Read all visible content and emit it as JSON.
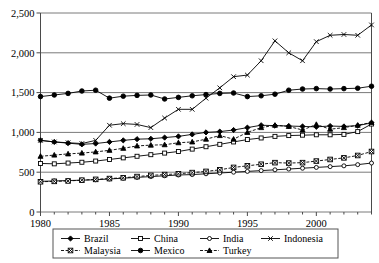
{
  "title_cropped": "",
  "chart_data": {
    "type": "line",
    "title": "",
    "subtitle": "",
    "xlabel": "",
    "ylabel": "",
    "xlim": [
      1980,
      2004
    ],
    "ylim": [
      0,
      2500
    ],
    "yticks": [
      0,
      500,
      1000,
      1500,
      2000,
      2500
    ],
    "ytick_labels": [
      "0",
      "500",
      "1,000",
      "1,500",
      "2,000",
      "2,500"
    ],
    "xticks": [
      1980,
      1985,
      1990,
      1995,
      2000
    ],
    "xtick_labels": [
      "1980",
      "1985",
      "1990",
      "1995",
      "2000"
    ],
    "x_minor_ticks_every": 1,
    "grid": "horizontal",
    "legend_position": "bottom",
    "x": [
      1980,
      1981,
      1982,
      1983,
      1984,
      1985,
      1986,
      1987,
      1988,
      1989,
      1990,
      1991,
      1992,
      1993,
      1994,
      1995,
      1996,
      1997,
      1998,
      1999,
      2000,
      2001,
      2002,
      2003,
      2004
    ],
    "series": [
      {
        "name": "Brazil",
        "marker": "filled-diamond",
        "dash": "solid",
        "values": [
          900,
          880,
          865,
          850,
          860,
          880,
          900,
          915,
          920,
          935,
          950,
          975,
          1000,
          1010,
          1030,
          1060,
          1090,
          1085,
          1080,
          1075,
          1070,
          1080,
          1075,
          1085,
          1120
        ]
      },
      {
        "name": "China",
        "marker": "open-square",
        "dash": "solid",
        "values": [
          610,
          605,
          615,
          625,
          640,
          660,
          680,
          700,
          720,
          740,
          760,
          790,
          820,
          850,
          880,
          910,
          930,
          950,
          960,
          965,
          970,
          970,
          975,
          1010,
          1105
        ]
      },
      {
        "name": "India",
        "marker": "open-circle",
        "dash": "solid",
        "values": [
          385,
          390,
          395,
          400,
          405,
          415,
          425,
          435,
          445,
          455,
          465,
          470,
          480,
          490,
          500,
          510,
          520,
          530,
          540,
          550,
          560,
          570,
          580,
          595,
          615
        ]
      },
      {
        "name": "Indonesia",
        "marker": "cross-x",
        "dash": "solid",
        "values": [
          900,
          880,
          870,
          860,
          900,
          1090,
          1110,
          1100,
          1060,
          1180,
          1290,
          1290,
          1430,
          1560,
          1700,
          1720,
          1900,
          2150,
          2000,
          1900,
          2140,
          2220,
          2230,
          2220,
          2350
        ]
      },
      {
        "name": "Malaysia",
        "marker": "boxed-x",
        "dash": "dashed",
        "values": [
          380,
          385,
          390,
          400,
          410,
          420,
          430,
          445,
          460,
          470,
          480,
          495,
          510,
          530,
          560,
          580,
          600,
          620,
          615,
          620,
          640,
          660,
          680,
          710,
          760
        ]
      },
      {
        "name": "Mexico",
        "marker": "filled-circle",
        "dash": "solid",
        "values": [
          1450,
          1470,
          1490,
          1520,
          1530,
          1430,
          1455,
          1465,
          1470,
          1420,
          1440,
          1460,
          1475,
          1490,
          1495,
          1450,
          1460,
          1480,
          1530,
          1545,
          1550,
          1545,
          1550,
          1555,
          1580
        ]
      },
      {
        "name": "Turkey",
        "marker": "filled-triangle",
        "dash": "dashed",
        "values": [
          700,
          715,
          730,
          740,
          755,
          775,
          800,
          830,
          840,
          845,
          870,
          880,
          915,
          960,
          915,
          1000,
          1060,
          1090,
          1075,
          1030,
          1100,
          1040,
          1060,
          1090,
          1125
        ]
      }
    ]
  },
  "legend": {
    "items": [
      {
        "label": "Brazil"
      },
      {
        "label": "China"
      },
      {
        "label": "India"
      },
      {
        "label": "Indonesia"
      },
      {
        "label": "Malaysia"
      },
      {
        "label": "Mexico"
      },
      {
        "label": "Turkey"
      }
    ]
  }
}
